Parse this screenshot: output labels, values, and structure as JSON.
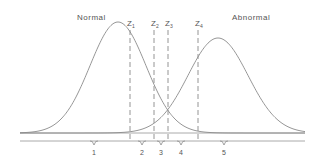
{
  "diagram": {
    "title": "",
    "distributions": [
      {
        "id": "normal",
        "label": "Normal",
        "peak_x": 118,
        "peak_y": 22,
        "sigma": 28
      },
      {
        "id": "abnormal",
        "label": "Abnormal",
        "peak_x": 218,
        "peak_y": 38,
        "sigma": 30
      }
    ],
    "thresholds": [
      {
        "id": "z1",
        "base": "Z",
        "sub": "1",
        "x": 130
      },
      {
        "id": "z2",
        "base": "Z",
        "sub": "2",
        "x": 154
      },
      {
        "id": "z3",
        "base": "Z",
        "sub": "3",
        "x": 168
      },
      {
        "id": "z4",
        "base": "Z",
        "sub": "4",
        "x": 198
      }
    ],
    "regions": [
      {
        "id": "r1",
        "label": "1",
        "x": 94
      },
      {
        "id": "r2",
        "label": "2",
        "x": 142
      },
      {
        "id": "r3",
        "label": "3",
        "x": 161
      },
      {
        "id": "r4",
        "label": "4",
        "x": 181
      },
      {
        "id": "r5",
        "label": "5",
        "x": 224
      }
    ],
    "colors": {
      "curve": "#8a8a8a",
      "dash": "#888888",
      "text": "#555555",
      "background": "#ffffff"
    }
  }
}
